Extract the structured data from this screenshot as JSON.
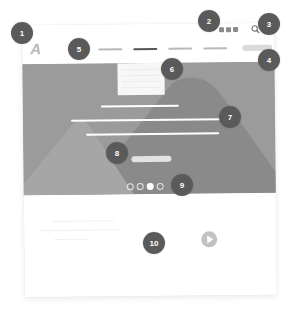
{
  "wireframe": {
    "logo": "A",
    "social_icons": [
      "social-icon-1",
      "social-icon-2",
      "social-icon-3"
    ],
    "search_icon": "search-icon",
    "nav_items": [
      {
        "label": "",
        "active": false
      },
      {
        "label": "",
        "active": true
      },
      {
        "label": "",
        "active": false
      },
      {
        "label": "",
        "active": false
      }
    ],
    "nav_cta": "",
    "hero": {
      "dropdown_lines": 4,
      "headline_lines": 3,
      "button": "",
      "carousel_dots": 4,
      "carousel_active": 3
    },
    "video_icon": "play-icon"
  },
  "callouts": [
    {
      "n": "1",
      "label": "logo"
    },
    {
      "n": "2",
      "label": "social-links"
    },
    {
      "n": "3",
      "label": "search"
    },
    {
      "n": "4",
      "label": "nav-cta-button"
    },
    {
      "n": "5",
      "label": "main-navigation"
    },
    {
      "n": "6",
      "label": "dropdown-menu"
    },
    {
      "n": "7",
      "label": "hero-headline"
    },
    {
      "n": "8",
      "label": "hero-button"
    },
    {
      "n": "9",
      "label": "carousel-indicators"
    },
    {
      "n": "10",
      "label": "video-play-button"
    }
  ],
  "colors": {
    "badge": "#5a5a5a",
    "hero_bg": "#9b9b9b",
    "mountain_dark": "#858585",
    "mountain_light": "#a8a8a8",
    "nav_active": "#555555",
    "nav_inactive": "#b9b9b9"
  }
}
